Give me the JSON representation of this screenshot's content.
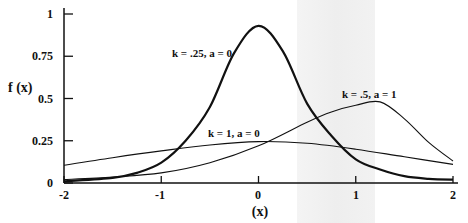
{
  "chart_data": {
    "type": "line",
    "title": "",
    "xlabel": "(x)",
    "ylabel": "f (x)",
    "xlim": [
      -2,
      2
    ],
    "ylim": [
      0,
      1
    ],
    "grid": false,
    "legend_position": "inline curve labels",
    "x_ticks": [
      "-2",
      "-1",
      "0",
      "1",
      "2"
    ],
    "y_ticks": [
      "0",
      "0.25",
      "0.5",
      "0.75",
      "1"
    ],
    "series": [
      {
        "name": "k = .25, a = 0",
        "line_weight": "bold",
        "x": [
          -2,
          -1.5,
          -1.25,
          -1,
          -0.75,
          -0.5,
          -0.25,
          0,
          0.25,
          0.5,
          0.75,
          1,
          1.25,
          1.5,
          1.75,
          2
        ],
        "y": [
          0.01,
          0.03,
          0.06,
          0.12,
          0.25,
          0.45,
          0.77,
          0.93,
          0.78,
          0.47,
          0.28,
          0.14,
          0.08,
          0.04,
          0.025,
          0.02
        ]
      },
      {
        "name": "k = .5, a = 1",
        "line_weight": "thin",
        "x": [
          -2,
          -1.5,
          -1,
          -0.5,
          0,
          0.5,
          0.75,
          1,
          1.25,
          1.5,
          1.75,
          2
        ],
        "y": [
          0.02,
          0.035,
          0.06,
          0.12,
          0.22,
          0.36,
          0.42,
          0.46,
          0.48,
          0.38,
          0.24,
          0.13
        ]
      },
      {
        "name": "k = 1, a = 0",
        "line_weight": "thin",
        "x": [
          -2,
          -1.5,
          -1,
          -0.5,
          0,
          0.5,
          1,
          1.5,
          2
        ],
        "y": [
          0.105,
          0.15,
          0.19,
          0.225,
          0.245,
          0.235,
          0.2,
          0.155,
          0.11
        ]
      }
    ],
    "annotations": [
      {
        "text": "k = .25, a = 0",
        "near_series": 0
      },
      {
        "text": "k = .5, a = 1",
        "near_series": 1
      },
      {
        "text": "k = 1, a = 0",
        "near_series": 2
      }
    ]
  },
  "labels": {
    "ylabel": "f (x)",
    "xlabel": "(x)",
    "curve0": "k = .25, a = 0",
    "curve1": "k = .5, a = 1",
    "curve2": "k = 1, a = 0",
    "xt0": "-2",
    "xt1": "-1",
    "xt2": "0",
    "xt3": "1",
    "xt4": "2",
    "yt0": "0",
    "yt1": "0.25",
    "yt2": "0.5",
    "yt3": "0.75",
    "yt4": "1"
  },
  "colors": {
    "ink": "#111111",
    "band": "#eeeeee",
    "background": "#ffffff"
  }
}
